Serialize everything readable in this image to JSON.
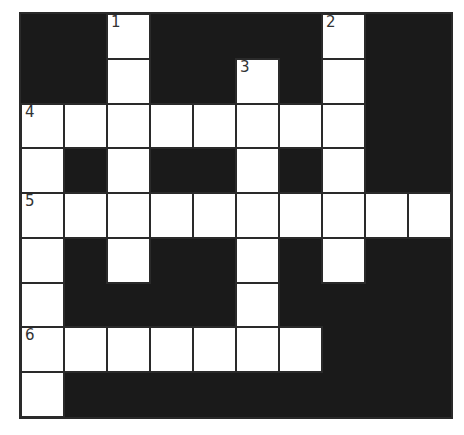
{
  "puzzle": {
    "type": "crossword",
    "rows": 9,
    "cols": 10,
    "colors": {
      "block": "#1a1a1a",
      "cell": "#ffffff",
      "line": "#2a2a2a",
      "number": "#333333"
    },
    "layout": [
      "..#....#..",
      "..#..#.#..",
      "########..",
      "#.#..#.#..",
      "##########",
      "#.#..#.#..",
      "#....#....",
      "#######...",
      "#........."
    ],
    "numbers": [
      {
        "row": 0,
        "col": 2,
        "label": "1"
      },
      {
        "row": 0,
        "col": 7,
        "label": "2"
      },
      {
        "row": 1,
        "col": 5,
        "label": "3"
      },
      {
        "row": 2,
        "col": 0,
        "label": "4"
      },
      {
        "row": 4,
        "col": 0,
        "label": "5"
      },
      {
        "row": 7,
        "col": 0,
        "label": "6"
      }
    ],
    "entries": [
      {
        "number": "1",
        "direction": "down",
        "length": 6
      },
      {
        "number": "2",
        "direction": "down",
        "length": 6
      },
      {
        "number": "3",
        "direction": "down",
        "length": 6
      },
      {
        "number": "4",
        "direction": "across",
        "length": 8
      },
      {
        "number": "4",
        "direction": "down",
        "length": 7
      },
      {
        "number": "5",
        "direction": "across",
        "length": 10
      },
      {
        "number": "6",
        "direction": "across",
        "length": 7
      }
    ]
  }
}
